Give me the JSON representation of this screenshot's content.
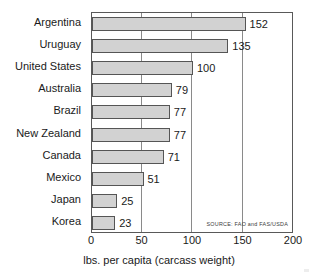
{
  "chart_data": {
    "type": "bar",
    "orientation": "horizontal",
    "title": "",
    "subtitle": "",
    "xlabel": "lbs. per capita (carcass weight)",
    "ylabel": "",
    "xlim": [
      0,
      200
    ],
    "xticks": [
      0,
      50,
      100,
      150,
      200
    ],
    "xtick_labels": [
      "0",
      "50",
      "100",
      "150",
      "200"
    ],
    "grid": "vertical gridlines at 50, 100, 150",
    "legend": "none",
    "annotations": [
      "SOURCE: FAO and FAS/USDA"
    ],
    "categories": [
      "Argentina",
      "Uruguay",
      "United States",
      "Australia",
      "Brazil",
      "New Zealand",
      "Canada",
      "Mexico",
      "Japan",
      "Korea"
    ],
    "values": [
      152,
      135,
      100,
      79,
      77,
      77,
      71,
      51,
      25,
      23
    ],
    "value_labels": [
      "152",
      "135",
      "100",
      "79",
      "77",
      "77",
      "71",
      "51",
      "25",
      "23"
    ],
    "colors": {
      "bar_fill": "#d2d2d2",
      "bar_border": "#555555",
      "frame": "#595959",
      "gridline": "#8a8a8a",
      "text": "#1a1a1a",
      "background": "#ffffff"
    }
  },
  "source": {
    "text": "SOURCE: FAO and FAS/USDA"
  }
}
